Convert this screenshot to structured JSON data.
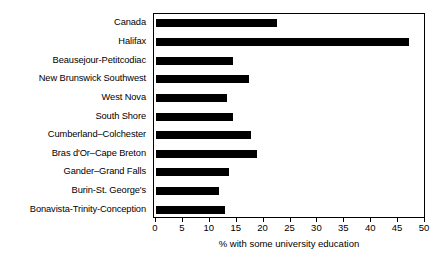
{
  "chart_data": {
    "type": "bar",
    "orientation": "horizontal",
    "title": "",
    "xlabel": "% with some university education",
    "ylabel": "",
    "xlim": [
      0,
      50
    ],
    "xticks": [
      0,
      5,
      10,
      15,
      20,
      25,
      30,
      35,
      40,
      45,
      50
    ],
    "grid": false,
    "legend": false,
    "bar_color": "#000000",
    "background_color": "#ffffff",
    "frame_color": "#000000",
    "categories": [
      "Canada",
      "Halifax",
      "Beausejour-Petitcodiac",
      "New Brunswick Southwest",
      "West Nova",
      "South Shore",
      "Cumberland–Colchester",
      "Bras d'Or–Cape Breton",
      "Gander–Grand Falls",
      "Burin-St. George's",
      "Bonavista-Trinity-Conception"
    ],
    "values": [
      22.4,
      47.0,
      14.4,
      17.2,
      13.2,
      14.3,
      17.6,
      18.7,
      13.5,
      11.7,
      12.8
    ]
  }
}
